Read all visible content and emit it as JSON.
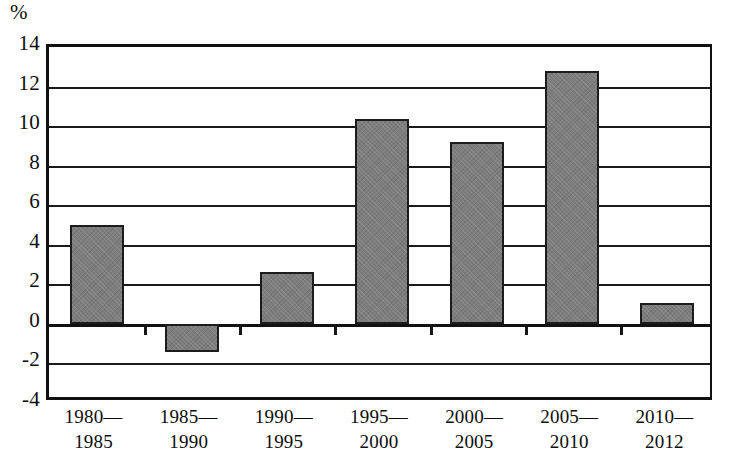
{
  "chart_data": {
    "type": "bar",
    "title": "",
    "xlabel": "",
    "ylabel": "%",
    "unit_label": "%",
    "categories": [
      "1980—1985",
      "1985—1990",
      "1990—1995",
      "1995—2000",
      "2000—2005",
      "2005—2010",
      "2010—2012"
    ],
    "category_lines": [
      {
        "line1": "1980—",
        "line2": "1985"
      },
      {
        "line1": "1985—",
        "line2": "1990"
      },
      {
        "line1": "1990—",
        "line2": "1995"
      },
      {
        "line1": "1995—",
        "line2": "2000"
      },
      {
        "line1": "2000—",
        "line2": "2005"
      },
      {
        "line1": "2005—",
        "line2": "2010"
      },
      {
        "line1": "2010—",
        "line2": "2012"
      }
    ],
    "values": [
      5.0,
      -1.4,
      2.6,
      10.35,
      9.2,
      12.8,
      1.05
    ],
    "ylim": [
      -4,
      14
    ],
    "ytick_labels": [
      "14",
      "12",
      "10",
      "8",
      "6",
      "4",
      "2",
      "0",
      "-2",
      "-4"
    ],
    "ytick_values": [
      14,
      12,
      10,
      8,
      6,
      4,
      2,
      0,
      -2,
      -4
    ],
    "grid": true,
    "legend": null,
    "bar_color": "#7d7d7d",
    "bar_border_color": "#1c1c1c",
    "axis_color": "#111111",
    "background_color": "#ffffff"
  }
}
